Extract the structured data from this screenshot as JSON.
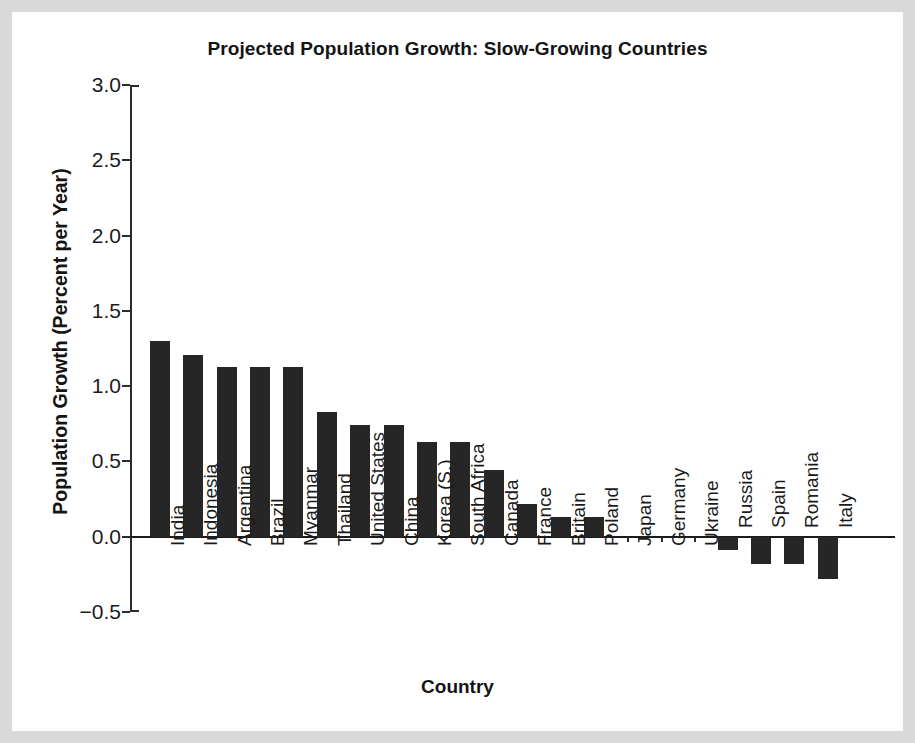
{
  "chart_data": {
    "type": "bar",
    "title": "Projected Population Growth: Slow-Growing Countries",
    "xlabel": "Country",
    "ylabel": "Population Growth (Percent per Year)",
    "ylim": [
      -0.5,
      3.0
    ],
    "yticks": [
      "3.0",
      "2.5",
      "2.0",
      "1.5",
      "1.0",
      "0.5",
      "0.0",
      "−0.5"
    ],
    "ytick_values": [
      3.0,
      2.5,
      2.0,
      1.5,
      1.0,
      0.5,
      0.0,
      -0.5
    ],
    "grid": false,
    "legend": false,
    "bar_color": "#262626",
    "categories": [
      "India",
      "Indonesia",
      "Argentina",
      "Brazil",
      "Myanmar",
      "Thailand",
      "United States",
      "China",
      "Korea (S.)",
      "South Africa",
      "Canada",
      "France",
      "Britain",
      "Poland",
      "Japan",
      "Germany",
      "Ukraine",
      "Russia",
      "Spain",
      "Romania",
      "Italy"
    ],
    "values": [
      1.3,
      1.21,
      1.13,
      1.13,
      1.13,
      0.83,
      0.74,
      0.74,
      0.63,
      0.63,
      0.44,
      0.22,
      0.13,
      0.13,
      0.0,
      0.0,
      0.0,
      -0.09,
      -0.18,
      -0.18,
      -0.28
    ]
  }
}
